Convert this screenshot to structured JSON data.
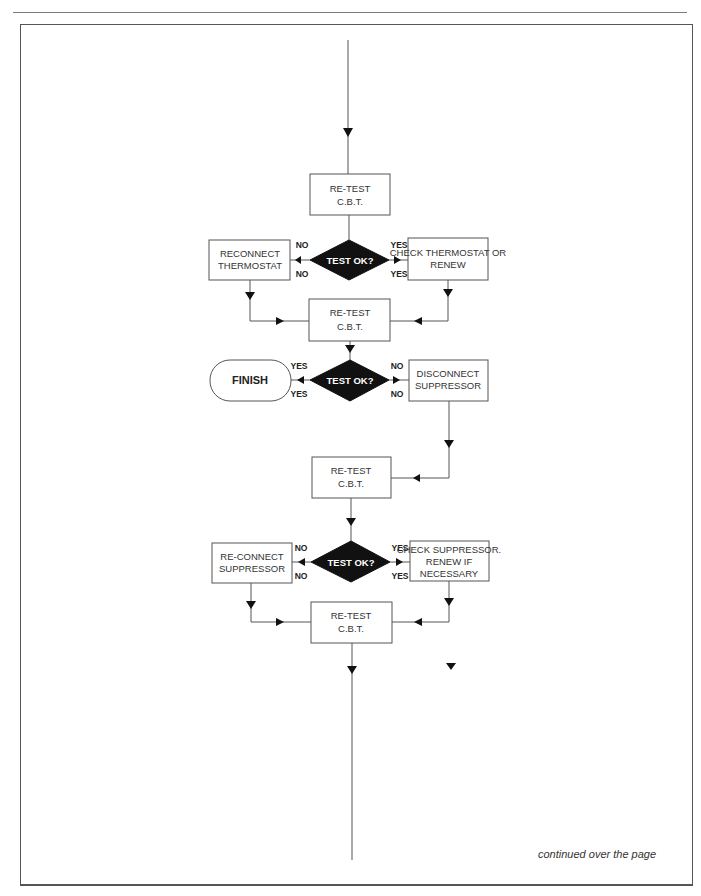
{
  "flowchart": {
    "retest1": {
      "line1": "RE-TEST",
      "line2": "C.B.T."
    },
    "decision1": {
      "label": "TEST OK?",
      "no_top": "NO",
      "no_bottom": "NO",
      "yes_top": "YES",
      "yes_bottom": "YES"
    },
    "reconnect_thermostat": {
      "line1": "RECONNECT",
      "line2": "THERMOSTAT"
    },
    "check_thermostat": {
      "line1": "CHECK THERMOSTAT OR",
      "line2": "RENEW"
    },
    "retest2": {
      "line1": "RE-TEST",
      "line2": "C.B.T."
    },
    "decision2": {
      "label": "TEST OK?",
      "yes_top": "YES",
      "yes_bottom": "YES",
      "no_top": "NO",
      "no_bottom": "NO"
    },
    "finish": {
      "label": "FINISH"
    },
    "disconnect_suppressor": {
      "line1": "DISCONNECT",
      "line2": "SUPPRESSOR"
    },
    "retest3": {
      "line1": "RE-TEST",
      "line2": "C.B.T."
    },
    "decision3": {
      "label": "TEST OK?",
      "no_top": "NO",
      "no_bottom": "NO",
      "yes_top": "YES",
      "yes_bottom": "YES"
    },
    "reconnect_suppressor": {
      "line1": "RE-CONNECT",
      "line2": "SUPPRESSOR"
    },
    "check_suppressor": {
      "line1": "CHECK SUPPRESSOR.",
      "line2": "RENEW IF",
      "line3": "NECESSARY"
    },
    "retest4": {
      "line1": "RE-TEST",
      "line2": "C.B.T."
    }
  },
  "footer": {
    "continued": "continued over the page"
  }
}
